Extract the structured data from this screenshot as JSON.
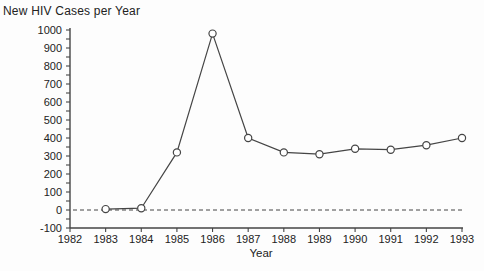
{
  "chart_data": {
    "type": "line",
    "title": "New HIV Cases per Year",
    "xlabel": "Year",
    "ylabel": "",
    "series_name": "New HIV cases per year",
    "x": [
      1983,
      1984,
      1985,
      1986,
      1987,
      1988,
      1989,
      1990,
      1991,
      1992,
      1993
    ],
    "values": [
      5,
      10,
      320,
      980,
      400,
      320,
      310,
      340,
      335,
      360,
      400
    ],
    "xlim": [
      1982,
      1993
    ],
    "ylim": [
      -100,
      1000
    ],
    "x_ticks": [
      1982,
      1983,
      1984,
      1985,
      1986,
      1987,
      1988,
      1989,
      1990,
      1991,
      1992,
      1993
    ],
    "y_ticks": [
      -100,
      0,
      100,
      200,
      300,
      400,
      500,
      600,
      700,
      800,
      900,
      1000
    ],
    "y_minor_tick_step": 50,
    "zero_line": {
      "value": 0,
      "style": "dashed"
    },
    "marker": "open-circle",
    "grid": false,
    "legend": false,
    "colors": {
      "line": "#454545",
      "axis": "#454545",
      "marker_fill": "#ffffff",
      "text": "#222222",
      "background": "#fdfdfd"
    }
  }
}
